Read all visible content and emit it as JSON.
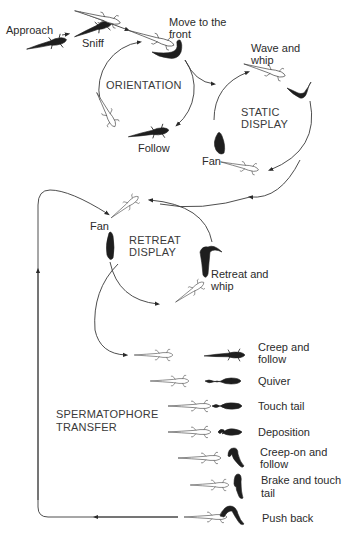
{
  "diagram": {
    "phases": [
      {
        "id": "orientation",
        "label": "ORIENTATION"
      },
      {
        "id": "static_display",
        "label_line1": "STATIC",
        "label_line2": "DISPLAY"
      },
      {
        "id": "retreat_display",
        "label_line1": "RETREAT",
        "label_line2": "DISPLAY"
      },
      {
        "id": "spermatophore_transfer",
        "label_line1": "SPERMATOPHORE",
        "label_line2": "TRANSFER"
      }
    ],
    "behaviours": {
      "approach": "Approach",
      "sniff": "Sniff",
      "move_to_front_1": "Move to the",
      "move_to_front_2": "front",
      "follow": "Follow",
      "wave_whip_1": "Wave and",
      "wave_whip_2": "whip",
      "fan_static": "Fan",
      "fan_retreat": "Fan",
      "retreat_whip_1": "Retreat and",
      "retreat_whip_2": "whip",
      "creep_follow_1": "Creep and",
      "creep_follow_2": "follow",
      "quiver": "Quiver",
      "touch_tail": "Touch tail",
      "deposition": "Deposition",
      "creep_on_1": "Creep-on and",
      "creep_on_2": "follow",
      "brake_touch_1": "Brake and touch",
      "brake_touch_2": "tail",
      "push_back": "Push back"
    },
    "icons": {
      "male": "dark-newt-silhouette",
      "female": "outline-newt-sketch",
      "arrow": "arrowhead"
    },
    "colors": {
      "background": "#ffffff",
      "line": "#3a3a3a",
      "male": "#1e1e1e"
    }
  }
}
